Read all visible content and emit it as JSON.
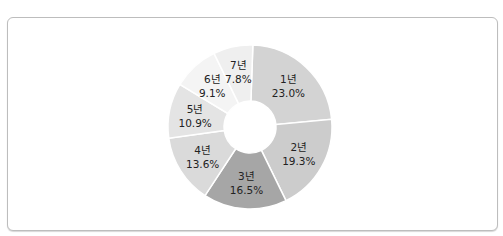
{
  "chart_data": {
    "type": "pie",
    "variant": "donut",
    "title": "",
    "categories": [
      "1년",
      "2년",
      "3년",
      "4년",
      "5년",
      "6년",
      "7년"
    ],
    "values": [
      23.0,
      19.3,
      16.5,
      13.6,
      10.9,
      9.1,
      7.8
    ],
    "labels": [
      "23.0%",
      "19.3%",
      "16.5%",
      "13.6%",
      "10.9%",
      "9.1%",
      "7.8%"
    ],
    "colors": [
      "#d3d3d3",
      "#cccccc",
      "#a6a6a6",
      "#dadada",
      "#e4e4e4",
      "#f4f4f4",
      "#efefef"
    ],
    "start_angle_deg": 2,
    "direction": "clockwise",
    "legend": "none"
  }
}
